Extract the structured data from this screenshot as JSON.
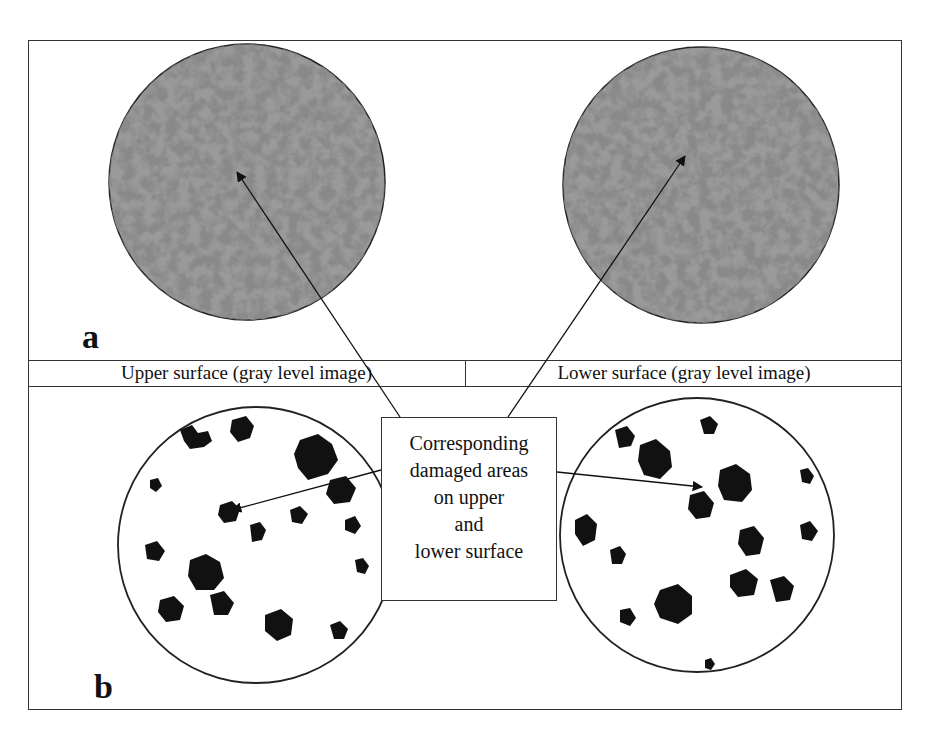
{
  "figure": {
    "panel_a": {
      "label": "a",
      "left_caption": "Upper surface (gray level image)",
      "right_caption": "Lower surface (gray level image)"
    },
    "panel_b": {
      "label": "b"
    },
    "callout": {
      "lines": [
        "Corresponding",
        "damaged areas",
        "on upper",
        "and",
        "lower surface"
      ]
    },
    "colors": {
      "frame": "#333333",
      "gray_disc_dark": "#3a3a3a",
      "gray_disc_light": "#9a9a9a",
      "damage_blob": "#111111"
    }
  }
}
